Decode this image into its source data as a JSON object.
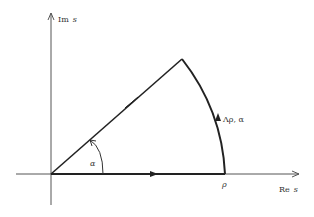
{
  "diagram": {
    "type": "contour",
    "axes": {
      "imag_label_main": "Im",
      "imag_label_var": "s",
      "real_label_main": "Re",
      "real_label_var": "s"
    },
    "labels": {
      "radius": "ρ",
      "arc": "Λρ, α",
      "angle": "α"
    },
    "colors": {
      "line": "#222222",
      "axis": "#555555",
      "background": "#ffffff"
    }
  }
}
